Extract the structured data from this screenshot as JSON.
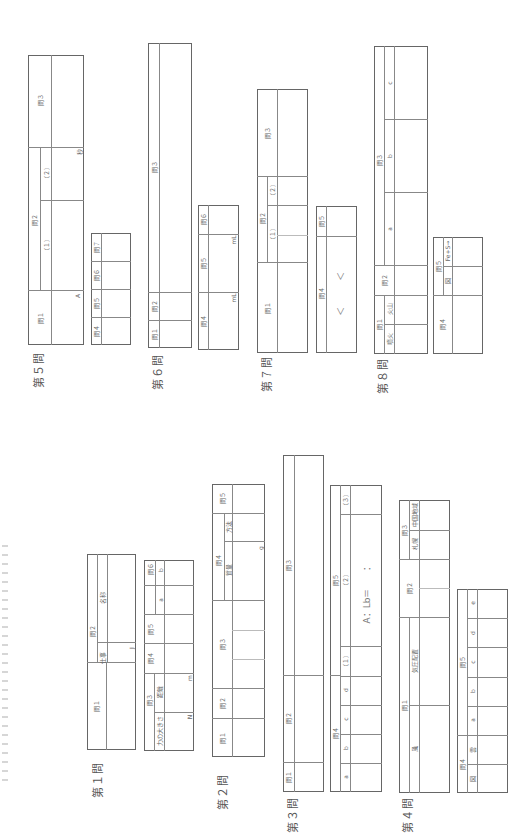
{
  "sections": {
    "q5": {
      "title": "第５問",
      "q1": "問１",
      "q2": "問２",
      "q2_1": "（１）",
      "q2_2": "（２）",
      "q3": "問３",
      "q4": "問４",
      "q5": "問５",
      "q6": "問６",
      "q7": "問７",
      "unit_a": "A",
      "unit_b": "秒"
    },
    "q6": {
      "title": "第６問",
      "q1": "問１",
      "q2": "問２",
      "q3": "問３",
      "q4": "問４",
      "q5": "問５",
      "q6": "問６",
      "unit_ml1": "mL",
      "unit_ml2": "mL"
    },
    "q7": {
      "title": "第７問",
      "q1": "問１",
      "q2": "問２",
      "q2_1": "（１）",
      "q2_2": "（２）",
      "q3": "問３",
      "q4": "問４",
      "q5": "問５",
      "lt1": "＜",
      "lt2": "＜"
    },
    "q8": {
      "title": "第８問",
      "q1": "問１",
      "q1_a": "噴火",
      "q1_b": "火山",
      "q2": "問２",
      "q3": "問３",
      "q3_a": "a",
      "q3_b": "b",
      "q3_c": "c",
      "q4": "問４",
      "q5": "問５",
      "q5_fig": "図",
      "q5_eq": "Fe+S→"
    },
    "q1": {
      "title": "第１問",
      "q1": "問１",
      "q2": "問２",
      "q2_work": "仕事",
      "q2_name": "名称",
      "unit_j": "J",
      "q3": "問３",
      "q3_force": "力の大きさ",
      "q3_dist": "距離",
      "unit_n": "N",
      "unit_m": "m",
      "q4": "問４",
      "q5": "問５",
      "q6": "問６",
      "q6_a": "a",
      "q6_b": "b",
      "q6_c": "c"
    },
    "q2": {
      "title": "第２問",
      "q1": "問１",
      "q2": "問２",
      "q3": "問３",
      "q4": "問４",
      "q4_mass": "質量",
      "q4_method": "方法",
      "unit_g": "g",
      "q5": "問５"
    },
    "q3": {
      "title": "第３問",
      "q1": "問１",
      "q2": "問２",
      "q3": "問３",
      "q4": "問４",
      "q4_a": "a",
      "q4_b": "b",
      "q4_c": "c",
      "q4_d": "d",
      "q5": "問５",
      "q5_1": "（１）",
      "q5_2": "（２）",
      "q5_3": "（３）",
      "ratio": "A：Lb＝　　：　"
    },
    "q4": {
      "title": "第４問",
      "q1": "問１",
      "q1_wind": "風",
      "q1_pressure": "気圧配置",
      "q2": "問２",
      "q3": "問３",
      "q3_city": "札幌",
      "q3_region": "中国地域",
      "q4": "問４",
      "q4_fig": "図",
      "q4_word": "雲",
      "q5": "問５",
      "q5_a": "a",
      "q5_b": "b",
      "q5_c": "c",
      "q5_d": "d",
      "q5_e": "e"
    }
  }
}
